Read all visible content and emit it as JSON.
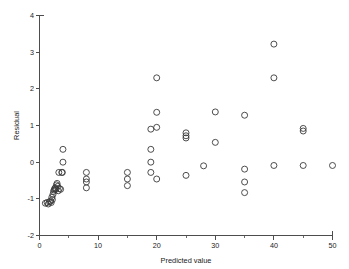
{
  "chart_data": {
    "type": "scatter",
    "title": "",
    "xlabel": "Predicted value",
    "ylabel": "Residual",
    "xlim": [
      0,
      50
    ],
    "ylim": [
      -2,
      4
    ],
    "xticks": [
      0,
      10,
      20,
      30,
      40,
      50
    ],
    "xtick_labels": [
      "0",
      "10",
      "20",
      "30",
      "40",
      "50"
    ],
    "xminor_ticks": [
      5,
      15,
      25,
      35,
      45
    ],
    "yticks": [
      -2,
      -1,
      0,
      1,
      2,
      3,
      4
    ],
    "ytick_labels": [
      "-2",
      "-1",
      "0",
      "1",
      "2",
      "3",
      "4"
    ],
    "grid": false,
    "legend": false,
    "marker": "open-circle",
    "marker_size": 3.0,
    "marker_color": "#3a3a3a",
    "series": [
      {
        "name": "residuals",
        "points": [
          [
            1.0,
            -1.12
          ],
          [
            1.3,
            -1.1
          ],
          [
            1.5,
            -1.14
          ],
          [
            1.7,
            -1.08
          ],
          [
            1.9,
            -1.06
          ],
          [
            2.0,
            -1.1
          ],
          [
            2.1,
            -0.96
          ],
          [
            2.2,
            -1.02
          ],
          [
            2.3,
            -0.88
          ],
          [
            2.4,
            -0.8
          ],
          [
            2.5,
            -0.76
          ],
          [
            2.6,
            -0.72
          ],
          [
            2.7,
            -0.7
          ],
          [
            2.8,
            -0.74
          ],
          [
            2.9,
            -0.62
          ],
          [
            3.0,
            -0.58
          ],
          [
            3.1,
            -0.66
          ],
          [
            3.2,
            -0.78
          ],
          [
            3.4,
            -0.72
          ],
          [
            3.6,
            -0.74
          ],
          [
            3.8,
            -0.28
          ],
          [
            3.9,
            -0.28
          ],
          [
            4.0,
            0.0
          ],
          [
            4.0,
            0.35
          ],
          [
            3.3,
            -0.28
          ],
          [
            8.0,
            -0.28
          ],
          [
            8.0,
            -0.46
          ],
          [
            8.0,
            -0.54
          ],
          [
            8.0,
            -0.7
          ],
          [
            15.0,
            -0.28
          ],
          [
            15.0,
            -0.46
          ],
          [
            15.0,
            -0.64
          ],
          [
            19.0,
            0.9
          ],
          [
            19.0,
            0.35
          ],
          [
            19.0,
            0.0
          ],
          [
            19.0,
            -0.28
          ],
          [
            20.0,
            2.3
          ],
          [
            20.0,
            1.36
          ],
          [
            20.0,
            0.95
          ],
          [
            20.0,
            -0.46
          ],
          [
            25.0,
            0.8
          ],
          [
            25.0,
            0.72
          ],
          [
            25.0,
            0.66
          ],
          [
            25.0,
            -0.36
          ],
          [
            28.0,
            -0.1
          ],
          [
            30.0,
            1.37
          ],
          [
            30.0,
            0.54
          ],
          [
            35.0,
            1.28
          ],
          [
            35.0,
            -0.19
          ],
          [
            35.0,
            -0.54
          ],
          [
            35.0,
            -0.83
          ],
          [
            40.0,
            3.22
          ],
          [
            40.0,
            2.3
          ],
          [
            40.0,
            -0.09
          ],
          [
            45.0,
            0.92
          ],
          [
            45.0,
            0.85
          ],
          [
            45.0,
            -0.09
          ],
          [
            50.0,
            -0.09
          ]
        ]
      }
    ]
  },
  "axes": {
    "x_axis_name": "x-axis",
    "y_axis_name": "y-axis"
  }
}
